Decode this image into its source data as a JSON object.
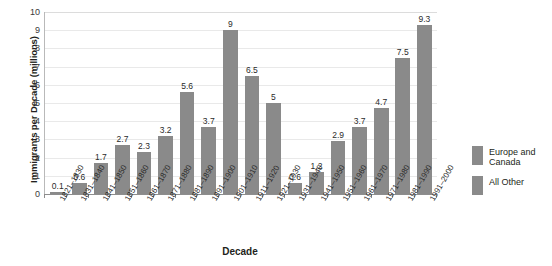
{
  "chart_data": {
    "type": "bar",
    "title": "",
    "xlabel": "Decade",
    "ylabel": "Immigrants per Decade (millions)",
    "ylim": [
      0,
      10
    ],
    "ytick_labels": [
      "10",
      "9",
      "8",
      "7",
      "6",
      "5",
      "4",
      "3",
      "2",
      "1",
      "0"
    ],
    "ytick_values": [
      10,
      9,
      8,
      7,
      6,
      5,
      4,
      3,
      2,
      1,
      0
    ],
    "grid": true,
    "legend_position": "right",
    "categories": [
      "1821–1830",
      "1831–1840",
      "1841–1850",
      "1851–1860",
      "1861–1870",
      "1871–1880",
      "1881–1890",
      "1891–1900",
      "1901–1910",
      "1911–1920",
      "1921–1930",
      "1931–1940",
      "1941–1950",
      "1951–1960",
      "1961–1970",
      "1971–1980",
      "1981–1990",
      "1991–2000"
    ],
    "values": [
      0.1,
      0.6,
      1.7,
      2.7,
      2.3,
      3.2,
      5.6,
      3.7,
      9,
      6.5,
      5,
      0.6,
      1.2,
      2.9,
      3.7,
      4.7,
      7.5,
      9.3
    ],
    "value_labels": [
      "0.1",
      "0.6",
      "1.7",
      "2.7",
      "2.3",
      "3.2",
      "5.6",
      "3.7",
      "9",
      "6.5",
      "5",
      "0.6",
      "1.2",
      "2.9",
      "3.7",
      "4.7",
      "7.5",
      "9.3"
    ],
    "series": [
      {
        "name": "Europe and Canada",
        "color": "#8a8a8a"
      },
      {
        "name": "All Other",
        "color": "#8a8a8a"
      }
    ],
    "legend": [
      {
        "label": "Europe and Canada",
        "color": "#8a8a8a"
      },
      {
        "label": "All Other",
        "color": "#8a8a8a"
      }
    ],
    "bar_color": "#8a8a8a",
    "background_color": "#ffffff",
    "gridline_color": "#e9e9e9"
  }
}
